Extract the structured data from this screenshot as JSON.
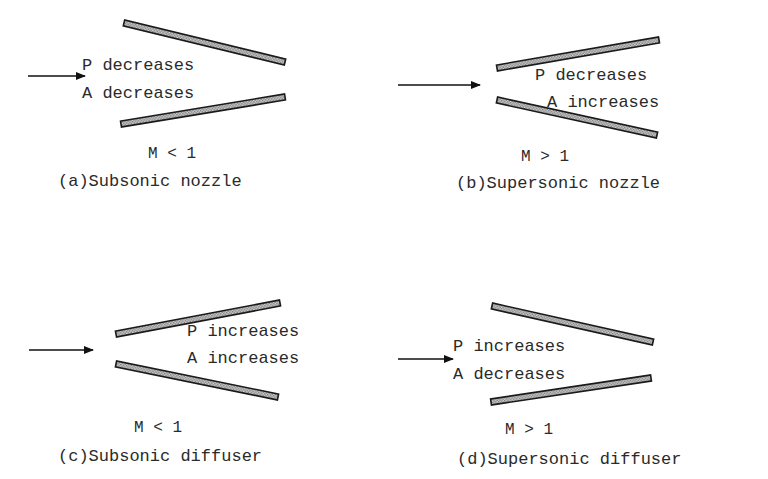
{
  "panels": [
    {
      "id": "a",
      "caption": "(a)Subsonic nozzle",
      "mach": "M < 1",
      "pressure": "P decreases",
      "area": "A decreases",
      "walls": [
        [
          124,
          23,
          285,
          62
        ],
        [
          121,
          124,
          285,
          97
        ]
      ],
      "arrow": [
        28,
        76,
        85,
        76
      ],
      "text_pos": {
        "p": [
          82,
          70
        ],
        "a": [
          82,
          98
        ],
        "mach": [
          148,
          158
        ],
        "caption": [
          58,
          186
        ]
      }
    },
    {
      "id": "b",
      "caption": "(b)Supersonic nozzle",
      "mach": "M > 1",
      "pressure": "P decreases",
      "area": "A increases",
      "walls": [
        [
          497,
          68,
          659,
          40
        ],
        [
          497,
          100,
          657,
          135
        ]
      ],
      "arrow": [
        398,
        85,
        480,
        85
      ],
      "text_pos": {
        "p": [
          535,
          80
        ],
        "a": [
          547,
          107
        ],
        "mach": [
          521,
          161
        ],
        "caption": [
          456,
          188
        ]
      }
    },
    {
      "id": "c",
      "caption": "(c)Subsonic diffuser",
      "mach": "M < 1",
      "pressure": "P increases",
      "area": "A increases",
      "walls": [
        [
          116,
          334,
          280,
          303
        ],
        [
          116,
          364,
          278,
          397
        ]
      ],
      "arrow": [
        29,
        350,
        93,
        350
      ],
      "text_pos": {
        "p": [
          187,
          336
        ],
        "a": [
          187,
          363
        ],
        "mach": [
          134,
          432
        ],
        "caption": [
          58,
          461
        ]
      }
    },
    {
      "id": "d",
      "caption": "(d)Supersonic diffuser",
      "mach": "M > 1",
      "pressure": "P increases",
      "area": "A decreases",
      "walls": [
        [
          492,
          306,
          653,
          342
        ],
        [
          491,
          402,
          651,
          378
        ]
      ],
      "arrow": [
        398,
        359,
        453,
        359
      ],
      "text_pos": {
        "p": [
          453,
          351
        ],
        "a": [
          453,
          379
        ],
        "mach": [
          505,
          434
        ],
        "caption": [
          457,
          464
        ]
      }
    }
  ],
  "colors": {
    "wall_outline": "#1a1a1a",
    "wall_fill": "#bdbdbd",
    "text": "#2a2a2a",
    "arrow": "#111111"
  }
}
